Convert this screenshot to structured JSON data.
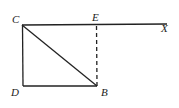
{
  "diagram": {
    "type": "geometry",
    "points": {
      "C": {
        "label": "C",
        "x": 22,
        "y": 25
      },
      "E": {
        "label": "E",
        "x": 96,
        "y": 25
      },
      "X": {
        "label": "X",
        "x": 167,
        "y": 24
      },
      "D": {
        "label": "D",
        "x": 23,
        "y": 86
      },
      "B": {
        "label": "B",
        "x": 97,
        "y": 86
      }
    },
    "segments": [
      {
        "from": "C",
        "to": "X",
        "style": "solid"
      },
      {
        "from": "C",
        "to": "D",
        "style": "solid"
      },
      {
        "from": "D",
        "to": "B",
        "style": "solid"
      },
      {
        "from": "C",
        "to": "B",
        "style": "solid"
      },
      {
        "from": "E",
        "to": "B",
        "style": "dashed"
      }
    ],
    "colors": {
      "stroke": "#222222",
      "background": "#ffffff"
    }
  }
}
